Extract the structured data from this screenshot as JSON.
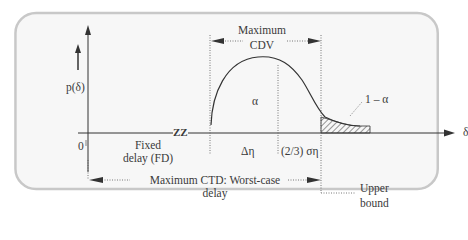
{
  "diagram": {
    "y_axis_label": "p(δ)",
    "x_axis_label": "δ",
    "origin_label": "0",
    "break_marker": "ZZ",
    "fixed_delay": {
      "line1": "Fixed",
      "line2": "delay (FD)"
    },
    "max_cdv": {
      "line1": "Maximum",
      "line2": "CDV"
    },
    "alpha_label": "α",
    "one_minus_alpha_label": "1 – α",
    "delta_eta_label": "Δη",
    "two_thirds_sigma_label": "(2/3) ση",
    "max_ctd": {
      "line1": "Maximum CTD: Worst-case",
      "line2": "delay"
    },
    "upper_bound": {
      "line1": "Upper",
      "line2": "bound"
    }
  },
  "colors": {
    "frame_border": "#c8c8c8",
    "frame_bg": "#f7f7f7",
    "ink": "#333333"
  }
}
